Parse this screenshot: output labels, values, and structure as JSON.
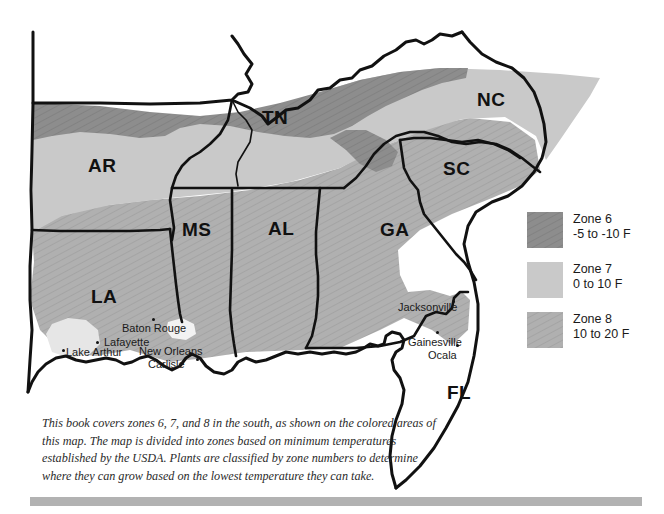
{
  "figure": {
    "name": "usda-plant-hardiness-zone-map-southern-us",
    "caption": "This book covers zones 6, 7, and 8 in the south, as shown on the colored areas of this map. The map is divided into zones based on minimum temperatures established by the USDA. Plants are classified by zone numbers to determine where they can grow based on the lowest temperature they can take."
  },
  "colors": {
    "zone6": "#8d8d8d",
    "zone7": "#c9c9c9",
    "zone8": "#b0b0b0",
    "zone9": "#e6e6e6",
    "outline": "#111111",
    "background": "#ffffff",
    "rule": "#b2b2b2",
    "text": "#1a1a1a"
  },
  "legend": {
    "name": "zone-legend",
    "entries": [
      {
        "swatch": "zone6-swatch",
        "zone": "Zone 6",
        "range": "-5 to -10 F",
        "color": "#8d8d8d",
        "pattern": "hatch"
      },
      {
        "swatch": "zone7-swatch",
        "zone": "Zone 7",
        "range": "0 to 10 F",
        "color": "#c9c9c9",
        "pattern": "solid"
      },
      {
        "swatch": "zone8-swatch",
        "zone": "Zone 8",
        "range": "10 to 20 F",
        "color": "#b0b0b0",
        "pattern": "hatch"
      }
    ]
  },
  "states": [
    {
      "abbr": "AR",
      "x": 88,
      "y": 155
    },
    {
      "abbr": "TN",
      "x": 262,
      "y": 107
    },
    {
      "abbr": "NC",
      "x": 477,
      "y": 89
    },
    {
      "abbr": "SC",
      "x": 443,
      "y": 158
    },
    {
      "abbr": "MS",
      "x": 182,
      "y": 219
    },
    {
      "abbr": "AL",
      "x": 268,
      "y": 218
    },
    {
      "abbr": "GA",
      "x": 380,
      "y": 219
    },
    {
      "abbr": "LA",
      "x": 91,
      "y": 286
    },
    {
      "abbr": "FL",
      "x": 447,
      "y": 382
    }
  ],
  "cities": [
    {
      "name": "Baton Rouge",
      "label_x": 122,
      "label_y": 322,
      "dot_x": 152,
      "dot_y": 318
    },
    {
      "name": "Lafayette",
      "label_x": 98,
      "label_y": 338,
      "dot_x": 96,
      "dot_y": 341
    },
    {
      "name": "Lake Arthur",
      "label_x": 66,
      "label_y": 346,
      "dot_x": 62,
      "dot_y": 349
    },
    {
      "name": "New Orleans",
      "label_x": 139,
      "label_y": 347,
      "dot_x": 189,
      "dot_y": 352
    },
    {
      "name": "Carlisle",
      "label_x": 148,
      "label_y": 360,
      "dot_x": 178,
      "dot_y": 363
    },
    {
      "name": "Jacksonville",
      "label_x": 398,
      "label_y": 303,
      "dot_x": 452,
      "dot_y": 300
    },
    {
      "name": "Gainesville",
      "label_x": 408,
      "label_y": 338,
      "dot_x": 436,
      "dot_y": 333
    },
    {
      "name": "Ocala",
      "label_x": 428,
      "label_y": 351,
      "dot_x": 456,
      "dot_y": 346
    }
  ]
}
